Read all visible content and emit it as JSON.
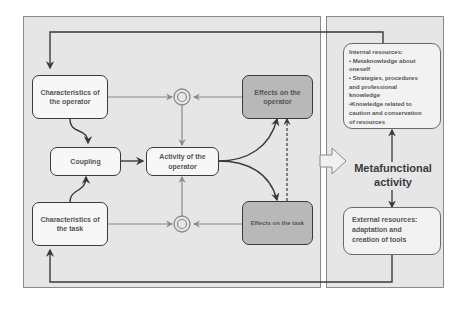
{
  "diagram": {
    "left_panel": {
      "nodes": {
        "char_operator": "Characteristics of the operator",
        "coupling": "Coupling",
        "char_task": "Characteristics of the task",
        "activity": "Activity of the operator",
        "effects_operator": "Effects on the operator",
        "effects_task": "Effects on the task"
      }
    },
    "right_panel": {
      "internal_resources": {
        "lines": [
          "Internal resources:",
          "• Metaknowledge about",
          "oneself",
          "• Strategies, procedures",
          "and professional",
          "knowledge",
          "•Knowledge related to",
          "caution and conservation",
          "of resources"
        ]
      },
      "metafunctional": [
        "Metafunctional",
        "activity"
      ],
      "external_resources": {
        "lines": [
          "External resources:",
          "adaptation and",
          "creation of tools"
        ]
      }
    },
    "colors": {
      "panel_bg": "#e6e6e6",
      "light_box": "#f7f7f7",
      "dark_box": "#b8b8b8",
      "line": "#3a3a3a",
      "grey_line": "#8a8a8a"
    }
  }
}
